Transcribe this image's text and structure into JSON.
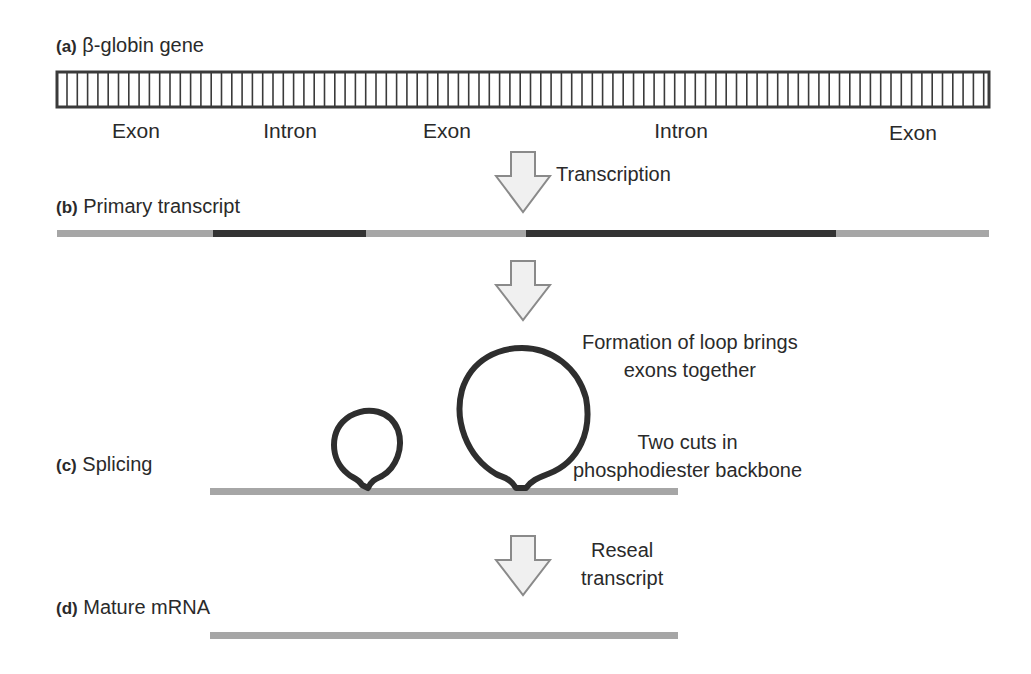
{
  "panels": {
    "a": {
      "tag": "(a)",
      "title": "β-globin gene"
    },
    "b": {
      "tag": "(b)",
      "title": "Primary transcript"
    },
    "c": {
      "tag": "(c)",
      "title": "Splicing"
    },
    "d": {
      "tag": "(d)",
      "title": "Mature mRNA"
    }
  },
  "gene_segments": [
    {
      "label": "Exon",
      "type": "exon"
    },
    {
      "label": "Intron",
      "type": "intron"
    },
    {
      "label": "Exon",
      "type": "exon"
    },
    {
      "label": "Intron",
      "type": "intron"
    },
    {
      "label": "Exon",
      "type": "exon"
    }
  ],
  "steps": {
    "transcription": "Transcription",
    "loop_line1": "Formation of loop brings",
    "loop_line2": "exons together",
    "cuts_line1": "Two cuts in",
    "cuts_line2": "phosphodiester backbone",
    "reseal_line1": "Reseal",
    "reseal_line2": "transcript"
  },
  "colors": {
    "exon": "#a6a6a6",
    "intron": "#333333",
    "dna_outline": "#3a3a3a",
    "arrow_fill": "#f0f0f0",
    "arrow_stroke": "#8a8a8a",
    "loop": "#2e2e2e"
  }
}
